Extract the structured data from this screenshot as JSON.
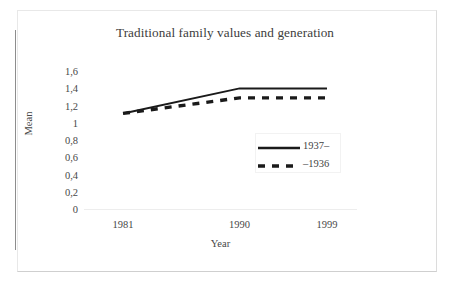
{
  "chart_data": {
    "type": "line",
    "title": "Traditional family values and generation",
    "xlabel": "Year",
    "ylabel": "Mean",
    "categories": [
      "1981",
      "1990",
      "1999"
    ],
    "x": [
      1981,
      1990,
      1999
    ],
    "series": [
      {
        "name": "1937–",
        "style": "solid",
        "color": "#1a1a1a",
        "values": [
          1.12,
          1.41,
          1.41
        ]
      },
      {
        "name": "–1936",
        "style": "dashed",
        "color": "#1a1a1a",
        "values": [
          1.12,
          1.3,
          1.3
        ]
      }
    ],
    "ylim": [
      0,
      1.6
    ],
    "yticks": [
      "0",
      "0,2",
      "0,4",
      "0,6",
      "0,8",
      "1",
      "1,2",
      "1,4",
      "1,6"
    ],
    "ytick_values": [
      0,
      0.2,
      0.4,
      0.6,
      0.8,
      1.0,
      1.2,
      1.4,
      1.6
    ],
    "grid": false,
    "legend_position": "inside-center-right"
  },
  "legend": {
    "entries": [
      {
        "label": "1937–",
        "style": "solid"
      },
      {
        "label": "–1936",
        "style": "dashed"
      }
    ]
  },
  "colors": {
    "line": "#1a1a1a",
    "text": "#474747",
    "title": "#3c3c3c",
    "frame": "#e8e8e8",
    "rule": "#8d8d8d"
  }
}
